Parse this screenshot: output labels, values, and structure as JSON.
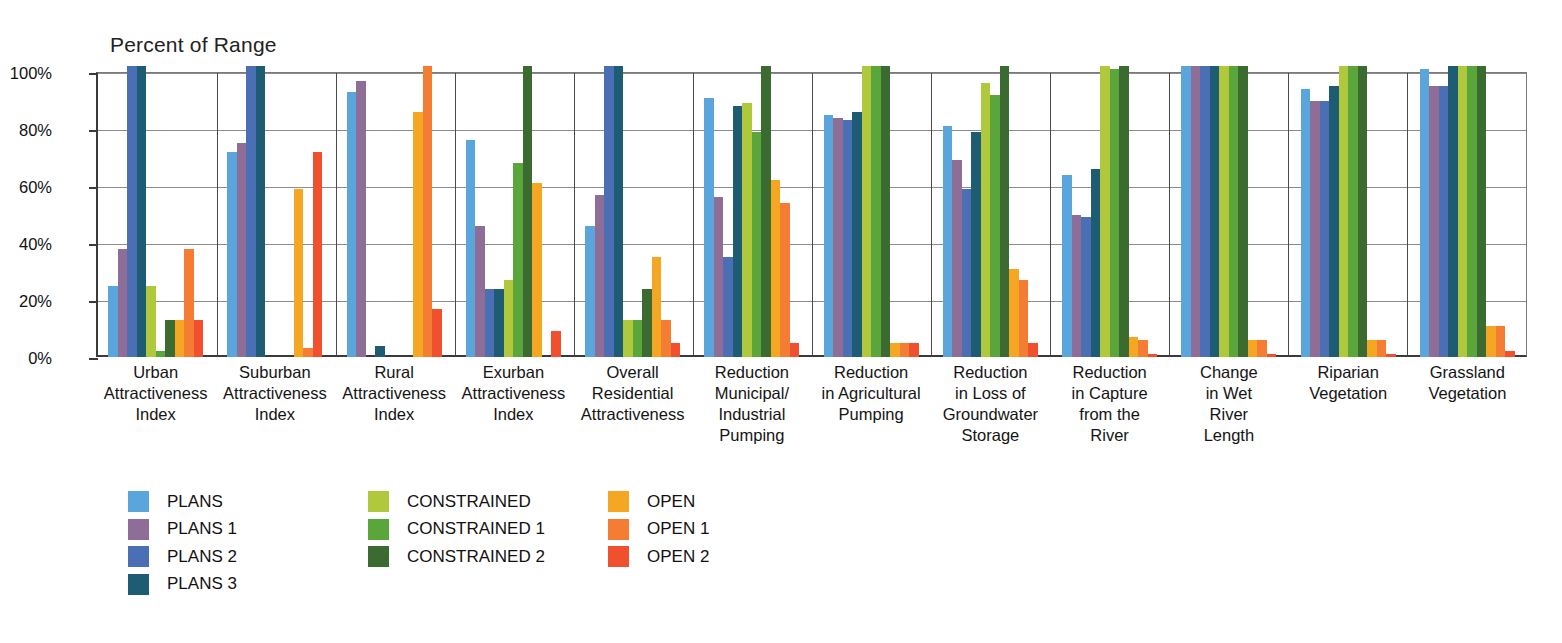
{
  "chart_data": {
    "type": "bar",
    "title": "",
    "ylabel": "Percent of Range",
    "xlabel": "",
    "ylim": [
      0,
      100
    ],
    "yticks": [
      "0%",
      "20%",
      "40%",
      "60%",
      "80%",
      "100%"
    ],
    "ytick_values": [
      0,
      20,
      40,
      60,
      80,
      100
    ],
    "grid": true,
    "legend_position": "bottom-left",
    "categories": [
      "Urban Attractiveness Index",
      "Suburban Attractiveness Index",
      "Rural Attractiveness Index",
      "Exurban Attractiveness Index",
      "Overall Residential Attractiveness",
      "Reduction Municipal/ Industrial Pumping",
      "Reduction in Agricultural Pumping",
      "Reduction in Loss of Groundwater Storage",
      "Reduction in Capture from the River",
      "Change in Wet River Length",
      "Riparian Vegetation",
      "Grassland Vegetation"
    ],
    "category_lines": [
      [
        "Urban",
        "Attractiveness",
        "Index"
      ],
      [
        "Suburban",
        "Attractiveness",
        "Index"
      ],
      [
        "Rural",
        "Attractiveness",
        "Index"
      ],
      [
        "Exurban",
        "Attractiveness",
        "Index"
      ],
      [
        "Overall",
        "Residential",
        "Attractiveness"
      ],
      [
        "Reduction",
        "Municipal/",
        "Industrial",
        "Pumping"
      ],
      [
        "Reduction",
        "in Agricultural",
        "Pumping"
      ],
      [
        "Reduction",
        "in Loss of",
        "Groundwater",
        "Storage"
      ],
      [
        "Reduction",
        "in Capture",
        "from the",
        "River"
      ],
      [
        "Change",
        "in Wet",
        "River",
        "Length"
      ],
      [
        "Riparian",
        "Vegetation"
      ],
      [
        "Grassland",
        "Vegetation"
      ]
    ],
    "series": [
      {
        "name": "PLANS",
        "color": "#59A5DC",
        "values": [
          25,
          72,
          93,
          76,
          46,
          91,
          85,
          81,
          64,
          102,
          94,
          101
        ]
      },
      {
        "name": "PLANS 1",
        "color": "#8E6E96",
        "values": [
          38,
          75,
          97,
          46,
          57,
          56,
          84,
          69,
          50,
          102,
          90,
          95
        ]
      },
      {
        "name": "PLANS 2",
        "color": "#4A6FB5",
        "values": [
          102,
          102,
          0,
          24,
          102,
          35,
          83,
          59,
          49,
          102,
          90,
          95
        ]
      },
      {
        "name": "PLANS 3",
        "color": "#1E5C74",
        "values": [
          102,
          102,
          4,
          24,
          102,
          88,
          86,
          79,
          66,
          102,
          95,
          102
        ]
      },
      {
        "name": "CONSTRAINED",
        "color": "#AFC83C",
        "values": [
          25,
          0,
          0,
          27,
          13,
          89,
          102,
          96,
          102,
          102,
          102,
          102
        ]
      },
      {
        "name": "CONSTRAINED 1",
        "color": "#5AA63B",
        "values": [
          2,
          0,
          0,
          68,
          13,
          79,
          102,
          92,
          101,
          102,
          102,
          102
        ]
      },
      {
        "name": "CONSTRAINED 2",
        "color": "#3C6B32",
        "values": [
          13,
          0,
          0,
          102,
          24,
          102,
          102,
          102,
          102,
          102,
          102,
          102
        ]
      },
      {
        "name": "OPEN",
        "color": "#F5A623",
        "values": [
          13,
          59,
          86,
          61,
          35,
          62,
          5,
          31,
          7,
          6,
          6,
          11
        ]
      },
      {
        "name": "OPEN 1",
        "color": "#F57C33",
        "values": [
          38,
          3,
          102,
          0,
          13,
          54,
          5,
          27,
          6,
          6,
          6,
          11
        ]
      },
      {
        "name": "OPEN 2",
        "color": "#F0502D",
        "values": [
          13,
          72,
          17,
          9,
          5,
          5,
          5,
          5,
          1,
          1,
          1,
          2
        ]
      }
    ]
  },
  "legend": {
    "columns": [
      {
        "items": [
          "PLANS",
          "PLANS 1",
          "PLANS 2",
          "PLANS 3"
        ]
      },
      {
        "items": [
          "CONSTRAINED",
          "CONSTRAINED 1",
          "CONSTRAINED 2"
        ]
      },
      {
        "items": [
          "OPEN",
          "OPEN 1",
          "OPEN 2"
        ]
      }
    ]
  }
}
